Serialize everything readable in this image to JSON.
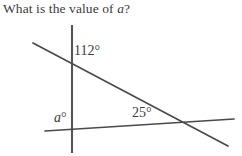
{
  "question": {
    "text_before_var": "What is the value of ",
    "variable": "a",
    "text_after_var": "?",
    "full_text": "What is the value of a?"
  },
  "figure": {
    "type": "geometry-diagram",
    "stroke_color": "#555555",
    "background_color": "#ffffff",
    "labels": {
      "angle_112": "112°",
      "angle_a": "a",
      "angle_a_degree_symbol": "°",
      "angle_25": "25°"
    },
    "values": {
      "known_angle_upper": 112,
      "known_angle_right": 25,
      "unknown_angle": "a"
    },
    "lines": [
      {
        "name": "vertical-line",
        "x1": 72,
        "y1": 25,
        "x2": 72,
        "y2": 153
      },
      {
        "name": "descending-transversal",
        "x1": 33,
        "y1": 43,
        "x2": 228,
        "y2": 146
      },
      {
        "name": "near-horizontal-transversal",
        "x1": 45,
        "y1": 131,
        "x2": 234,
        "y2": 119
      }
    ]
  }
}
